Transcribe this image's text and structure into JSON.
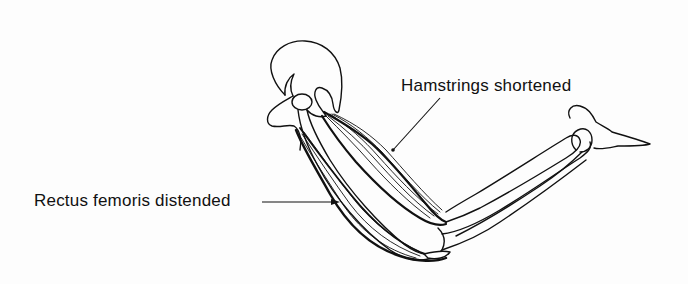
{
  "figure": {
    "colors": {
      "ink": "#111111",
      "background": "#fdfdfd"
    }
  },
  "labels": {
    "hamstrings": "Hamstrings shortened",
    "rectus_femoris": "Rectus femoris distended"
  }
}
